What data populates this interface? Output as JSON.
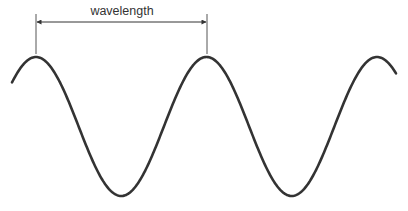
{
  "diagram": {
    "label": "wavelength",
    "colors": {
      "wave": "#333333",
      "annotation": "#444444",
      "background": "#ffffff"
    },
    "wave": {
      "type": "sine",
      "peaks_x": [
        36,
        207,
        377
      ],
      "troughs_x": [
        122,
        292
      ],
      "peak_y": 57,
      "trough_y": 196,
      "start": [
        12,
        84
      ],
      "end": [
        396,
        77
      ]
    },
    "annotation": {
      "from_x": 36,
      "to_x": 207,
      "arrow_y": 22,
      "tick_top": 14,
      "tick_bottom": 54,
      "label_x": 122,
      "label_y": 15
    }
  }
}
